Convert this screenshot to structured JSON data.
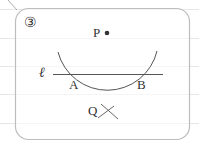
{
  "problem": {
    "number": "③",
    "labels": {
      "P": "P",
      "A": "A",
      "B": "B",
      "Q": "Q",
      "line": "ℓ"
    }
  },
  "colors": {
    "stroke": "#555555",
    "frame": "#bdbdbd",
    "ruled_line": "#e6e6e6",
    "text": "#333333"
  }
}
